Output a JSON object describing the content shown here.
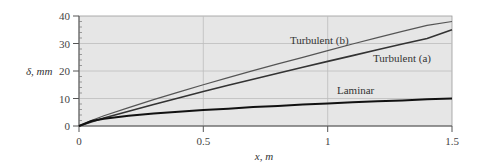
{
  "chart_data": {
    "type": "line",
    "title": "",
    "xlabel": "x, m",
    "ylabel": "δ, mm",
    "xlim": [
      0,
      1.5
    ],
    "ylim": [
      0,
      40
    ],
    "x_ticks": [
      "0",
      "0.5",
      "1",
      "1.5"
    ],
    "y_ticks": [
      "0",
      "10",
      "20",
      "30",
      "40"
    ],
    "grid": true,
    "x": [
      0,
      0.05,
      0.1,
      0.2,
      0.3,
      0.4,
      0.5,
      0.6,
      0.7,
      0.8,
      0.9,
      1.0,
      1.1,
      1.2,
      1.3,
      1.4,
      1.5
    ],
    "series": [
      {
        "name": "Turbulent (b)",
        "values": [
          0,
          2.0,
          3.7,
          6.7,
          9.6,
          12.3,
          15.0,
          17.6,
          20.1,
          22.6,
          25.0,
          27.4,
          29.8,
          32.1,
          34.4,
          36.6,
          38.0
        ]
      },
      {
        "name": "Turbulent (a)",
        "values": [
          0,
          1.5,
          2.9,
          5.4,
          7.8,
          10.2,
          12.5,
          14.8,
          17.0,
          19.2,
          21.4,
          23.5,
          25.6,
          27.7,
          29.8,
          31.8,
          35.0
        ]
      },
      {
        "name": "Laminar",
        "values": [
          0,
          1.8,
          2.6,
          3.7,
          4.5,
          5.2,
          5.8,
          6.3,
          6.9,
          7.3,
          7.8,
          8.2,
          8.6,
          9.0,
          9.3,
          9.7,
          10.0
        ]
      }
    ],
    "annotations": [
      {
        "text": "Turbulent (b)",
        "x": 0.93,
        "y": 31
      },
      {
        "text": "Turbulent (a)",
        "x": 1.22,
        "y": 22
      },
      {
        "text": "Laminar",
        "x": 1.06,
        "y": 12.5
      }
    ],
    "legend": "none (inline curve labels)"
  },
  "axes": {
    "x_label": "x, m",
    "y_label": "δ, mm",
    "x_tick_labels": [
      "0",
      "0.5",
      "1",
      "1.5"
    ],
    "y_tick_labels": [
      "0",
      "10",
      "20",
      "30",
      "40"
    ]
  },
  "labels": {
    "turb_b": "Turbulent (b)",
    "turb_a": "Turbulent (a)",
    "laminar": "Laminar"
  },
  "colors": {
    "plot_bg": "#e6e6e6",
    "grid": "#b8b8b8",
    "axis": "#555555",
    "turb_b": "#555555",
    "turb_a": "#333333",
    "laminar": "#111111"
  }
}
